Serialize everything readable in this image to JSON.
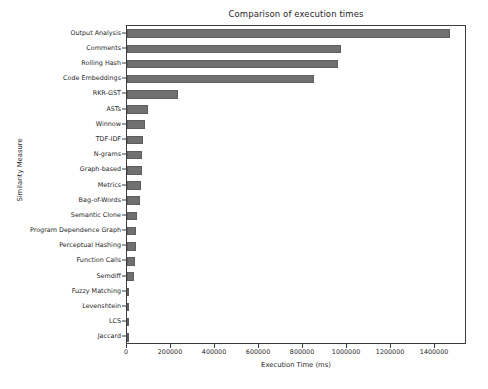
{
  "chart_data": {
    "type": "bar",
    "orientation": "horizontal",
    "title": "Comparison of execution times",
    "xlabel": "Execution Time (ms)",
    "ylabel": "Similarity Measure",
    "grid": false,
    "legend": null,
    "xlim": [
      0,
      1545000
    ],
    "xticks": [
      0,
      200000,
      400000,
      600000,
      800000,
      1000000,
      1200000,
      1400000
    ],
    "xtick_labels": [
      "0",
      "200000",
      "400000",
      "600000",
      "800000",
      "1000000",
      "1200000",
      "1400000"
    ],
    "bar_color": "#707070",
    "categories": [
      "Output Analysis",
      "Comments",
      "Rolling Hash",
      "Code Embeddings",
      "RKR-GST",
      "ASTs",
      "Winnow",
      "TDF-IDF",
      "N-grams",
      "Graph-based",
      "Metrics",
      "Bag-of-Words",
      "Semantic Clone",
      "Program Dependence Graph",
      "Perceptual Hashing",
      "Function Calls",
      "Semdiff",
      "Fuzzy Matching",
      "Levenshtein",
      "LCS",
      "Jaccard"
    ],
    "values": [
      1468000,
      972000,
      958000,
      850000,
      232000,
      95000,
      83000,
      73000,
      70000,
      68000,
      62000,
      61000,
      45000,
      43000,
      40000,
      36000,
      32000,
      10000,
      4000,
      3000,
      1500
    ]
  }
}
